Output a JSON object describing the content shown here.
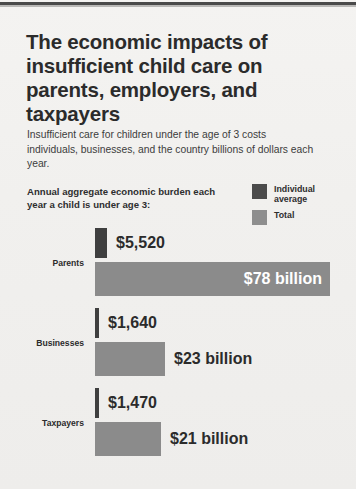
{
  "infographic": {
    "title": "The economic impacts of insufficient child care on parents, employers, and taxpayers",
    "subtitle": "Insufficient care for children under the age of 3 costs individuals, businesses, and the country billions of dollars each year.",
    "chart_intro": "Annual aggregate economic burden each year a child is under age 3:",
    "legend": [
      {
        "label": "Individual average",
        "color": "#4b4b4b"
      },
      {
        "label": "Total",
        "color": "#8e8e8e"
      }
    ]
  },
  "chart_data": {
    "type": "bar",
    "title": "Annual aggregate economic burden each year a child is under age 3:",
    "xlabel": "",
    "ylabel": "",
    "orientation": "horizontal",
    "grid": false,
    "legend_position": "top-right",
    "categories": [
      "Parents",
      "Businesses",
      "Taxpayers"
    ],
    "series": [
      {
        "name": "Individual average",
        "color": "#3f3f3f",
        "unit": "dollars per year",
        "values": [
          5520,
          1640,
          1470
        ],
        "labels": [
          "$5,520",
          "$1,640",
          "$1,470"
        ]
      },
      {
        "name": "Total",
        "color": "#8b8b8b",
        "unit": "billions of dollars per year",
        "values": [
          78,
          23,
          21
        ],
        "labels": [
          "$78 billion",
          "$23 billion",
          "$21 billion"
        ]
      }
    ]
  },
  "rows": [
    {
      "category": "Parents",
      "individual_label": "$5,520",
      "individual_width": "12px",
      "total_label": "$78 billion",
      "total_width": "235px",
      "total_label_inside": true
    },
    {
      "category": "Businesses",
      "individual_label": "$1,640",
      "individual_width": "4px",
      "total_label": "$23 billion",
      "total_width": "70px",
      "total_label_inside": false
    },
    {
      "category": "Taxpayers",
      "individual_label": "$1,470",
      "individual_width": "4px",
      "total_label": "$21 billion",
      "total_width": "66px",
      "total_label_inside": false
    }
  ]
}
